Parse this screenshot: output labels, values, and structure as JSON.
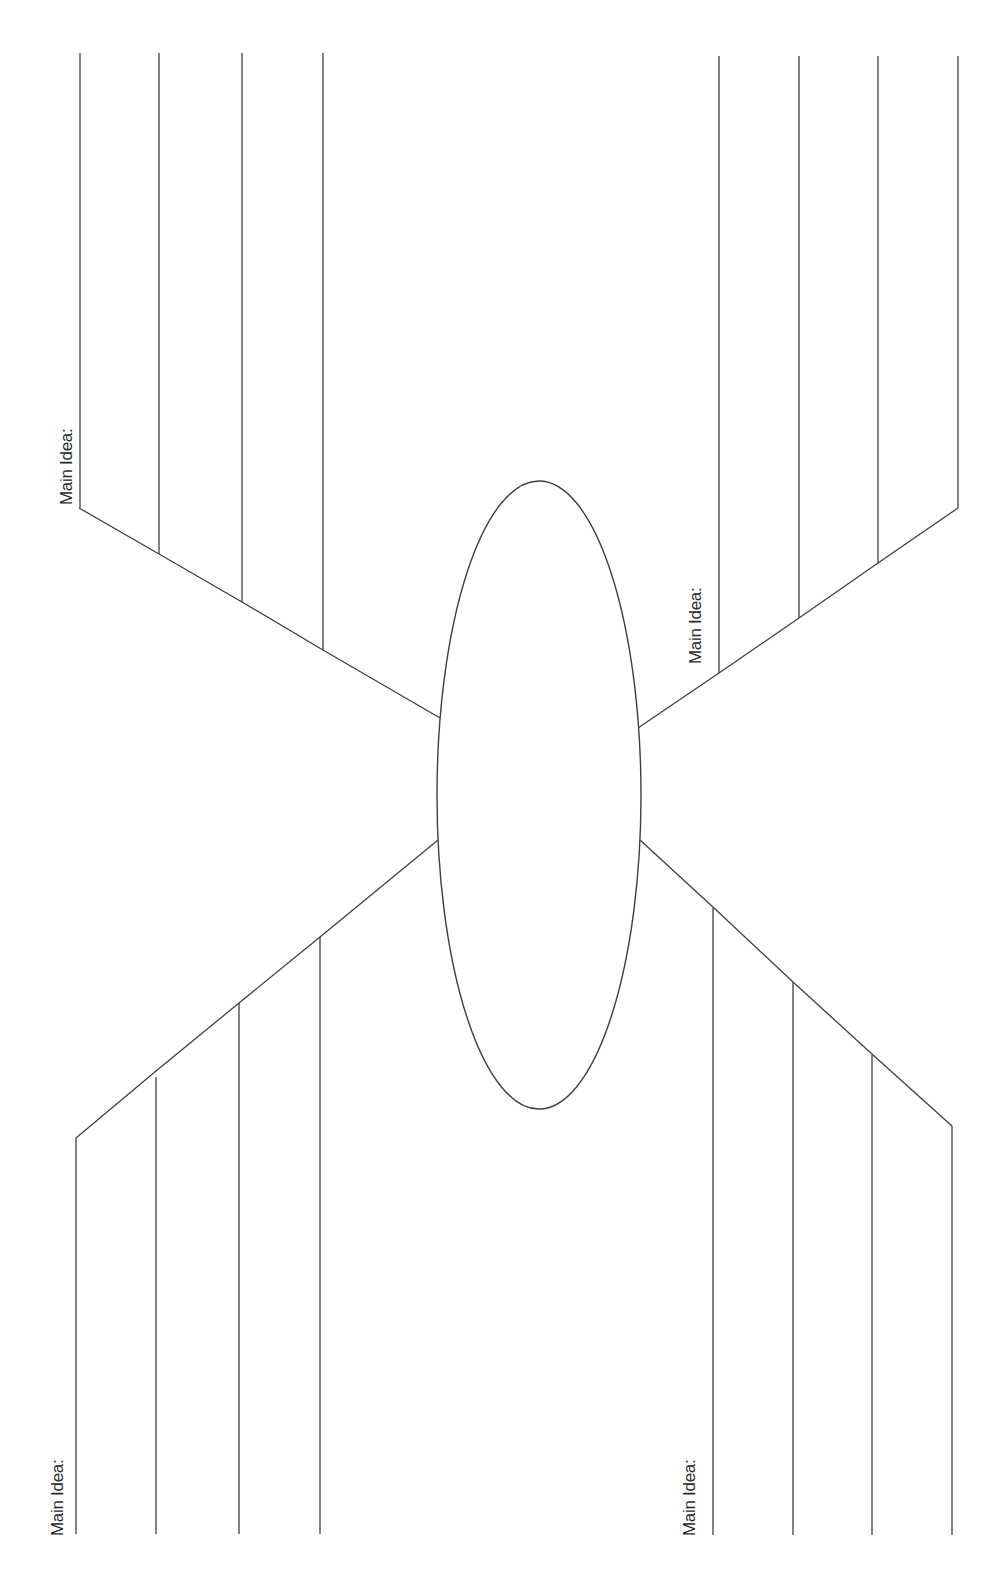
{
  "worksheet": {
    "type": "spider-map graphic organizer",
    "title_cutoff": "",
    "stroke_color": "#3f3f3f",
    "background_color": "#ffffff",
    "center_topic": {
      "shape": "ellipse",
      "cx": 539,
      "cy": 795,
      "rx": 102,
      "ry": 314,
      "text": ""
    },
    "branches": [
      {
        "id": "top-left",
        "label": "Main Idea:",
        "label_pos": {
          "x": 57,
          "y": 505
        },
        "diagonal": [
          [
            440,
            718
          ],
          [
            323,
            650
          ],
          [
            242,
            602
          ],
          [
            159,
            554
          ],
          [
            79,
            508
          ]
        ],
        "detail_lines": [
          {
            "x": 80,
            "y1": 53,
            "y2": 508
          },
          {
            "x": 159,
            "y1": 53,
            "y2": 554
          },
          {
            "x": 242,
            "y1": 53,
            "y2": 602
          },
          {
            "x": 323,
            "y1": 53,
            "y2": 650
          }
        ]
      },
      {
        "id": "top-right",
        "label": "Main Idea:",
        "label_pos": {
          "x": 686,
          "y": 664
        },
        "diagonal": [
          [
            638,
            728
          ],
          [
            719,
            673
          ],
          [
            799,
            618
          ],
          [
            878,
            563
          ],
          [
            958,
            508
          ]
        ],
        "detail_lines": [
          {
            "x": 719,
            "y1": 56,
            "y2": 673
          },
          {
            "x": 799,
            "y1": 56,
            "y2": 618
          },
          {
            "x": 878,
            "y1": 56,
            "y2": 563
          },
          {
            "x": 958,
            "y1": 56,
            "y2": 508
          }
        ]
      },
      {
        "id": "bottom-left",
        "label": "Main Idea:",
        "label_pos": {
          "x": 48,
          "y": 1536
        },
        "diagonal": [
          [
            438,
            840
          ],
          [
            320,
            937
          ],
          [
            239,
            1003
          ],
          [
            156,
            1071
          ],
          [
            76,
            1138
          ]
        ],
        "detail_lines": [
          {
            "x": 76,
            "y1": 1138,
            "y2": 1534
          },
          {
            "x": 156,
            "y1": 1077,
            "y2": 1534
          },
          {
            "x": 239,
            "y1": 1003,
            "y2": 1534
          },
          {
            "x": 320,
            "y1": 937,
            "y2": 1534
          }
        ]
      },
      {
        "id": "bottom-right",
        "label": "Main Idea:",
        "label_pos": {
          "x": 680,
          "y": 1536
        },
        "diagonal": [
          [
            640,
            840
          ],
          [
            714,
            908
          ],
          [
            793,
            982
          ],
          [
            873,
            1055
          ],
          [
            952,
            1126
          ]
        ],
        "detail_lines": [
          {
            "x": 713,
            "y1": 908,
            "y2": 1535
          },
          {
            "x": 793,
            "y1": 982,
            "y2": 1535
          },
          {
            "x": 872,
            "y1": 1055,
            "y2": 1535
          },
          {
            "x": 952,
            "y1": 1126,
            "y2": 1535
          }
        ]
      }
    ]
  }
}
